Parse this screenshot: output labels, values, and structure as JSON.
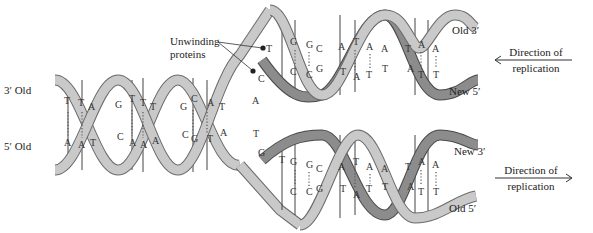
{
  "diagram": {
    "type": "dna-replication-fork",
    "labels": {
      "unwinding": "Unwinding\nproteins",
      "unwinding_line1": "Unwinding",
      "unwinding_line2": "proteins",
      "left_top": "3′ Old",
      "left_bottom": "5′ Old",
      "upper_right_top": "Old 3′",
      "upper_right_bottom": "New 5′",
      "lower_right_top": "New 3′",
      "lower_right_bottom": "Old 5′",
      "direction_upper_line1": "Direction of",
      "direction_upper_line2": "replication",
      "direction_lower_line1": "Direction of",
      "direction_lower_line2": "replication"
    },
    "parent_helix_pairs": [
      [
        "T",
        "A"
      ],
      [
        "T",
        "A"
      ],
      [
        "A",
        "T"
      ],
      [
        "G",
        "C"
      ],
      [
        "T",
        "A"
      ],
      [
        "T",
        "A"
      ],
      [
        "T",
        "A"
      ],
      [
        "G",
        "C"
      ],
      [
        "C",
        "G"
      ],
      [
        "A",
        "T"
      ],
      [
        "T",
        "A"
      ],
      [
        "A",
        "T"
      ]
    ],
    "upper_daughter_pairs": [
      [
        "T",
        "C"
      ],
      [
        "G",
        "C"
      ],
      [
        "G",
        "C"
      ],
      [
        "C",
        "G"
      ],
      [
        "A",
        "T"
      ],
      [
        "T",
        "A"
      ],
      [
        "A",
        "T"
      ],
      [
        "A",
        "T"
      ],
      [
        "T",
        "A"
      ],
      [
        "A",
        "T"
      ],
      [
        "A",
        "T"
      ]
    ],
    "lower_daughter_pairs": [
      [
        "G",
        ""
      ],
      [
        "T",
        ""
      ],
      [
        "G",
        "C"
      ],
      [
        "G",
        "C"
      ],
      [
        "C",
        "G"
      ],
      [
        "A",
        "T"
      ],
      [
        "T",
        "A"
      ],
      [
        "A",
        "T"
      ],
      [
        "A",
        "T"
      ],
      [
        "T",
        "A"
      ],
      [
        "A",
        "T"
      ],
      [
        "A",
        "T"
      ]
    ],
    "colors": {
      "old_strand": "#c8c8c8",
      "new_strand": "#8a8a8a",
      "outline": "#555555",
      "text": "#222222"
    }
  }
}
